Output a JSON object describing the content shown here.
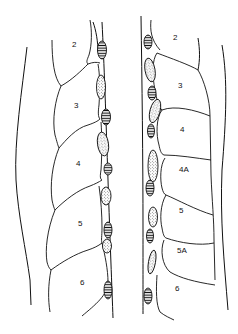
{
  "figure": {
    "left_column": {
      "labels": [
        {
          "text": "2",
          "x": 74,
          "y": 46
        },
        {
          "text": "3",
          "x": 76,
          "y": 107
        },
        {
          "text": "4",
          "x": 78,
          "y": 164
        },
        {
          "text": "5",
          "x": 80,
          "y": 225
        },
        {
          "text": "6",
          "x": 82,
          "y": 284
        }
      ]
    },
    "right_column": {
      "labels": [
        {
          "text": "2",
          "x": 175,
          "y": 40
        },
        {
          "text": "3",
          "x": 180,
          "y": 87
        },
        {
          "text": "4",
          "x": 182,
          "y": 131
        },
        {
          "text": "4A",
          "x": 183,
          "y": 171
        },
        {
          "text": "5",
          "x": 181,
          "y": 212
        },
        {
          "text": "5A",
          "x": 181,
          "y": 252
        },
        {
          "text": "6",
          "x": 176,
          "y": 290
        }
      ]
    },
    "legend_patterns": {
      "striped": "horizontal-hatched oval",
      "stippled": "dotted oval"
    },
    "colors": {
      "ink": "#111111",
      "background": "#ffffff"
    }
  }
}
